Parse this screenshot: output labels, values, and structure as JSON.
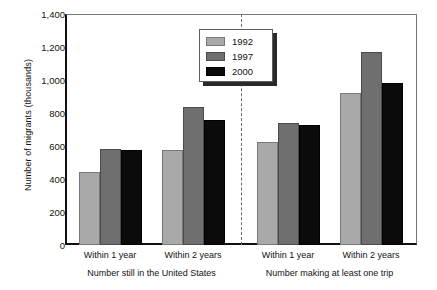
{
  "chart_data": {
    "type": "bar",
    "title": "",
    "xlabel": "",
    "ylabel": "Number of migrants (thousands)",
    "ylim": [
      0,
      1400
    ],
    "ytick_step": 200,
    "ytick_labels": [
      "1,400",
      "1,200",
      "1,000",
      "800",
      "600",
      "400",
      "200",
      "0"
    ],
    "ytick_values": [
      1400,
      1200,
      1000,
      800,
      600,
      400,
      200,
      0
    ],
    "grid": false,
    "legend_position": "top-center",
    "categories": [
      "Within 1 year",
      "Within 2 years",
      "Within 1 year",
      "Within 2 years"
    ],
    "panels": [
      {
        "label": "Number still in the United States",
        "categories": [
          "Within 1 year",
          "Within 2 years"
        ]
      },
      {
        "label": "Number making at least one trip",
        "categories": [
          "Within 1 year",
          "Within 2 years"
        ]
      }
    ],
    "series": [
      {
        "name": "1992",
        "color": "#a9a9a9",
        "values": [
          445,
          575,
          625,
          920
        ]
      },
      {
        "name": "1997",
        "color": "#6f6f6f",
        "values": [
          580,
          835,
          740,
          1170
        ]
      },
      {
        "name": "2000",
        "color": "#0b0b0b",
        "values": [
          575,
          760,
          725,
          980
        ]
      }
    ],
    "divider": true,
    "annotations": []
  },
  "legend": {
    "entries": [
      {
        "label": "1992",
        "swatch": "swatch-1992"
      },
      {
        "label": "1997",
        "swatch": "swatch-1997"
      },
      {
        "label": "2000",
        "swatch": "swatch-2000"
      }
    ]
  },
  "axes": {
    "y_title": "Number of migrants (thousands)",
    "y_labels": [
      "1,400",
      "1,200",
      "1,000",
      "800",
      "600",
      "400",
      "200",
      "0"
    ],
    "x_tick_labels": [
      "Within 1 year",
      "Within 2 years",
      "Within 1 year",
      "Within 2 years"
    ],
    "x_group_labels": [
      "Number still in the United States",
      "Number making at least one trip"
    ]
  },
  "colors": {
    "series_1992": "#a9a9a9",
    "series_1997": "#6f6f6f",
    "series_2000": "#0b0b0b",
    "axis": "#111111",
    "frame": "#77777a",
    "divider": "#6a6a6a",
    "background": "#ffffff"
  }
}
